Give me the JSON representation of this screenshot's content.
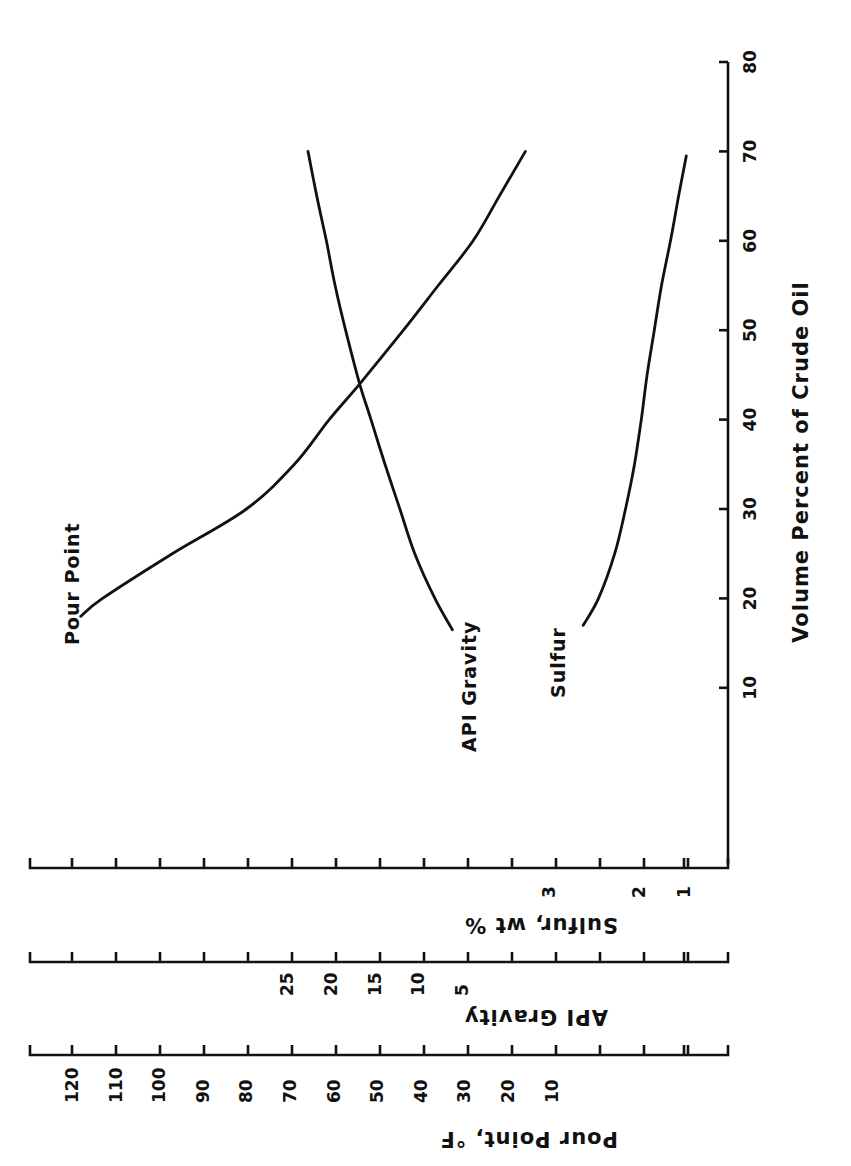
{
  "chart_data": {
    "type": "line",
    "orientation": "rotated 90 degrees counter-clockwise",
    "title": "",
    "xlabel": "Volume Percent of Crude Oil",
    "x_ticks": [
      10,
      20,
      30,
      40,
      50,
      60,
      70,
      80
    ],
    "xlim": [
      0,
      80
    ],
    "y_axes": [
      {
        "name": "pour",
        "label": "Pour Point, °F",
        "tick_labels": [
          120,
          110,
          100,
          90,
          80,
          70,
          60,
          50,
          40,
          30,
          20,
          10
        ],
        "tick_positions": [
          120,
          110,
          100,
          90,
          80,
          70,
          60,
          50,
          40,
          30,
          20,
          10,
          0,
          -10,
          -20
        ],
        "ylim": [
          -30,
          130
        ]
      },
      {
        "name": "api",
        "label": "API Gravity",
        "tick_labels": [
          25,
          20,
          15,
          10,
          5
        ],
        "ylim": [
          -10,
          40
        ]
      },
      {
        "name": "sulfur",
        "label": "Sulfur, wt %",
        "tick_labels": [
          3,
          2,
          1
        ],
        "ylim": [
          0.5,
          8
        ]
      }
    ],
    "series": [
      {
        "name": "Pour Point",
        "axis": "pour",
        "x": [
          18,
          20,
          25,
          30,
          35,
          40,
          44,
          50,
          55,
          60,
          65,
          70
        ],
        "y": [
          118,
          113,
          97,
          80,
          69,
          61,
          54,
          44,
          36,
          28,
          22,
          16
        ]
      },
      {
        "name": "API Gravity",
        "axis": "api",
        "x": [
          16.5,
          20,
          25,
          30,
          35,
          40,
          44,
          50,
          55,
          60,
          65,
          70
        ],
        "y": [
          6.1,
          8.1,
          10.4,
          12.1,
          13.8,
          15.4,
          16.7,
          18.3,
          19.5,
          20.5,
          21.6,
          22.6
        ]
      },
      {
        "name": "Sulfur",
        "axis": "sulfur",
        "x": [
          17,
          20,
          25,
          30,
          35,
          40,
          45,
          50,
          55,
          60,
          65,
          69.5
        ],
        "y": [
          2.62,
          2.45,
          2.27,
          2.15,
          2.05,
          1.95,
          1.82,
          1.66,
          1.5,
          1.3,
          1.12,
          0.95
        ]
      }
    ],
    "grid": false,
    "legend": "inline curve labels"
  },
  "labels": {
    "x_axis_title": "Volume Percent of Crude Oil",
    "pour_axis_title": "Pour Point, °F",
    "api_axis_title": "API Gravity",
    "sulfur_axis_title": "Sulfur, wt %",
    "curve_pour": "Pour Point",
    "curve_api": "API Gravity",
    "curve_sulfur": "Sulfur"
  }
}
